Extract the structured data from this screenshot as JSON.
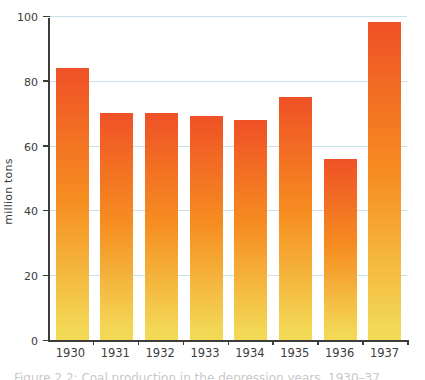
{
  "figure": {
    "caption_partial": "Figure 2.2: Coal production in the depression years, 1930–37"
  },
  "chart_data": {
    "type": "bar",
    "categories": [
      "1930",
      "1931",
      "1932",
      "1933",
      "1934",
      "1935",
      "1936",
      "1937"
    ],
    "values": [
      84,
      70,
      70,
      69,
      68,
      75,
      56,
      98
    ],
    "title": "",
    "xlabel": "",
    "ylabel": "million tons",
    "ylim": [
      0,
      100
    ],
    "yticks": [
      0,
      20,
      40,
      60,
      80,
      100
    ],
    "grid": true,
    "legend": "none",
    "colors": {
      "bar_gradient_top": "#ef5126",
      "bar_gradient_mid": "#f68d20",
      "bar_gradient_bottom": "#f3d855",
      "gridline": "#c6e3ec",
      "axis": "#3c3c3b",
      "text": "#3c3c3b",
      "caption": "#9b9b9b"
    }
  }
}
